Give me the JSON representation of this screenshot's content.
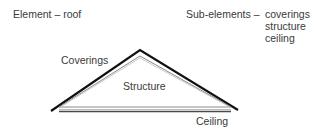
{
  "header": {
    "element_label": "Element – roof",
    "subelements_label": "Sub-elements –",
    "subelements": [
      "coverings",
      "structure",
      "ceiling"
    ]
  },
  "diagram": {
    "labels": {
      "coverings": "Coverings",
      "structure": "Structure",
      "ceiling": "Ceiling"
    },
    "colors": {
      "outer_roof": "#111111",
      "inner_structure": "#888888",
      "ceiling": "#555555"
    }
  }
}
